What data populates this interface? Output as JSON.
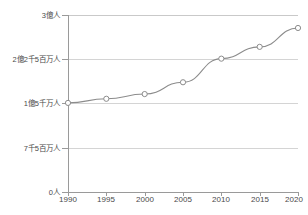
{
  "chart_data": {
    "type": "line",
    "title": "",
    "subtitle": "",
    "xlabel": "",
    "ylabel": "",
    "x": [
      1990,
      1995,
      2000,
      2005,
      2010,
      2015,
      2020
    ],
    "categories": [
      "1990",
      "1995",
      "2000",
      "2005",
      "2010",
      "2015",
      "2020"
    ],
    "values": [
      151000000,
      158000000,
      166000000,
      186000000,
      226000000,
      246000000,
      278000000
    ],
    "series": [
      {
        "name": "",
        "values": [
          151000000,
          158000000,
          166000000,
          186000000,
          226000000,
          246000000,
          278000000
        ]
      }
    ],
    "ylim": [
      0,
      300000000
    ],
    "xlim": [
      1990,
      2020
    ],
    "ytick_values": [
      0,
      75000000,
      150000000,
      225000000,
      300000000
    ],
    "ytick_labels": [
      "0人",
      "7千5百万人",
      "1億5千万人",
      "2億2千5百万人",
      "3億人"
    ],
    "xtick_labels": [
      "1990",
      "1995",
      "2000",
      "2005",
      "2010",
      "2015",
      "2020"
    ],
    "grid": true,
    "grid_axis": "y",
    "legend": false,
    "legend_position": "none",
    "marker": "circle-open",
    "line_color": "#8c8c8c",
    "marker_fill": "#ffffff",
    "grid_color": "#d4d4d4",
    "axis_color": "#9a9a9a",
    "text_color": "#4a4a4a",
    "background": "#ffffff"
  },
  "axis": {
    "y_labels": [
      {
        "text": "3億人",
        "value": 300000000
      },
      {
        "text": "2億2千5百万人",
        "value": 225000000
      },
      {
        "text": "1億5千万人",
        "value": 150000000
      },
      {
        "text": "7千5百万人",
        "value": 75000000
      },
      {
        "text": "0人",
        "value": 0
      }
    ],
    "x_labels": [
      {
        "text": "1990"
      },
      {
        "text": "1995"
      },
      {
        "text": "2000"
      },
      {
        "text": "2005"
      },
      {
        "text": "2010"
      },
      {
        "text": "2015"
      },
      {
        "text": "2020"
      }
    ]
  }
}
